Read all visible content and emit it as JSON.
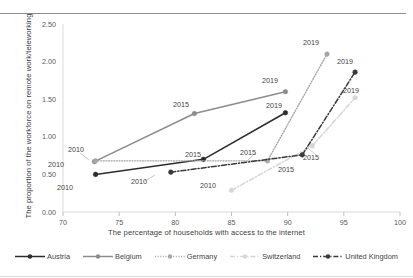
{
  "chart_data": {
    "type": "line",
    "title": "",
    "xlabel": "The percentage of households with access to the internet",
    "ylabel": "The proportion of the workforce on remote work/teleworking",
    "xlim": [
      70,
      100
    ],
    "ylim": [
      0,
      2.5
    ],
    "xticks": [
      "70",
      "75",
      "80",
      "85",
      "90",
      "95",
      "100"
    ],
    "yticks": [
      "0.00",
      "0.50",
      "1.00",
      "1.50",
      "2.00",
      "2.50"
    ],
    "grid": false,
    "legend_position": "bottom",
    "series": [
      {
        "name": "Austria",
        "color": "#2c2c2c",
        "style": "solid",
        "points": [
          {
            "label": "2010",
            "x": 72.9,
            "y": 0.5
          },
          {
            "label": "2015",
            "x": 82.5,
            "y": 0.7
          },
          {
            "label": "2019",
            "x": 89.8,
            "y": 1.32
          }
        ]
      },
      {
        "name": "Belgium",
        "color": "#8c8c8c",
        "style": "solid",
        "points": [
          {
            "label": "2010",
            "x": 72.8,
            "y": 0.67
          },
          {
            "label": "2015",
            "x": 81.7,
            "y": 1.31
          },
          {
            "label": "2019",
            "x": 89.8,
            "y": 1.6
          }
        ]
      },
      {
        "name": "Germany",
        "color": "#a6a6a6",
        "style": "dotted",
        "points": [
          {
            "label": "2010",
            "x": 72.9,
            "y": 0.68
          },
          {
            "label": "2015",
            "x": 88.2,
            "y": 0.68
          },
          {
            "label": "2019",
            "x": 93.5,
            "y": 2.1
          }
        ]
      },
      {
        "name": "Switzerland",
        "color": "#d6d6d6",
        "style": "dashdot",
        "points": [
          {
            "label": "2010",
            "x": 85.0,
            "y": 0.29
          },
          {
            "label": "2015",
            "x": 92.2,
            "y": 0.88
          },
          {
            "label": "2019",
            "x": 96.0,
            "y": 1.52
          }
        ]
      },
      {
        "name": "United Kingdom",
        "color": "#3a3a3a",
        "style": "dashdot",
        "points": [
          {
            "label": "2010",
            "x": 79.6,
            "y": 0.53
          },
          {
            "label": "2015",
            "x": 91.3,
            "y": 0.76
          },
          {
            "label": "2019",
            "x": 96.0,
            "y": 1.86
          }
        ]
      }
    ],
    "point_labels": [
      {
        "text": "2010",
        "series": "Austria",
        "x": 57,
        "y": 183
      },
      {
        "text": "2010",
        "series": "Belgium",
        "x": 48,
        "y": 160
      },
      {
        "text": "2010",
        "series": "Germany",
        "x": 68,
        "y": 145
      },
      {
        "text": "2010",
        "series": "United Kingdom",
        "x": 131,
        "y": 177
      },
      {
        "text": "2010",
        "series": "Switzerland",
        "x": 200,
        "y": 181
      },
      {
        "text": "2015",
        "series": "Belgium",
        "x": 173,
        "y": 100
      },
      {
        "text": "2015",
        "series": "Austria",
        "x": 185,
        "y": 150
      },
      {
        "text": "2015",
        "series": "Germany",
        "x": 240,
        "y": 148
      },
      {
        "text": "2015",
        "series": "United Kingdom",
        "x": 278,
        "y": 165
      },
      {
        "text": "2015",
        "series": "Switzerland",
        "x": 303,
        "y": 153
      },
      {
        "text": "2019",
        "series": "Belgium",
        "x": 262,
        "y": 76
      },
      {
        "text": "2019",
        "series": "Austria",
        "x": 266,
        "y": 101
      },
      {
        "text": "2019",
        "series": "Germany",
        "x": 303,
        "y": 38
      },
      {
        "text": "2019",
        "series": "United Kingdom",
        "x": 337,
        "y": 57
      },
      {
        "text": "2019",
        "series": "Switzerland",
        "x": 343,
        "y": 86
      }
    ]
  }
}
